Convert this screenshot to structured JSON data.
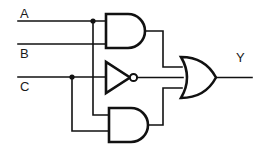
{
  "diagram": {
    "type": "digital-logic-schematic",
    "line_color": "#111111",
    "background_color": "#ffffff"
  },
  "labels": {
    "input_a": "A",
    "input_b": "B",
    "input_c": "C",
    "output_y": "Y"
  },
  "inputs": [
    {
      "name": "A",
      "label": "A",
      "y": 21
    },
    {
      "name": "B",
      "label": "B",
      "y": 44
    },
    {
      "name": "C",
      "label": "C",
      "y": 77
    }
  ],
  "gates": [
    {
      "id": "and-top",
      "type": "AND",
      "inputs": [
        "A",
        "B"
      ],
      "output": "A AND B"
    },
    {
      "id": "not-mid",
      "type": "NOT",
      "inputs": [
        "C"
      ],
      "output": "NOT C"
    },
    {
      "id": "and-bottom",
      "type": "AND",
      "inputs": [
        "A",
        "C"
      ],
      "output": "A AND C"
    },
    {
      "id": "or-out",
      "type": "OR",
      "inputs": [
        "A AND B",
        "NOT C",
        "A AND C"
      ],
      "output": "Y"
    }
  ],
  "junctions": [
    {
      "name": "junction-a",
      "on": "A",
      "x": 93,
      "y": 21
    },
    {
      "name": "junction-c",
      "on": "C",
      "x": 72,
      "y": 77
    }
  ],
  "expression": "Y = (A AND B) OR (NOT C) OR (A AND C)"
}
